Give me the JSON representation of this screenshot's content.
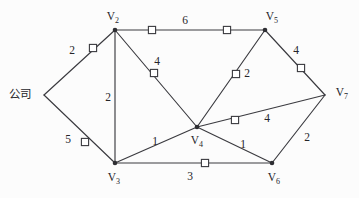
{
  "diagram": {
    "width": 359,
    "height": 198,
    "background_color": "#fcfcfc",
    "line_color": "#3a3a3f",
    "text_color": "#25252a",
    "marker_fill": "#ffffff"
  },
  "nodes": [
    {
      "id": "company",
      "label": "公司",
      "label_kind": "text",
      "x": 44,
      "y": 95,
      "label_x": 20,
      "label_y": 95,
      "has_dot": false
    },
    {
      "id": "v2",
      "label": "V",
      "sub": "2",
      "label_kind": "vertex",
      "x": 115,
      "y": 30,
      "label_x": 113,
      "label_y": 17,
      "has_dot": true
    },
    {
      "id": "v3",
      "label": "V",
      "sub": "3",
      "label_kind": "vertex",
      "x": 115,
      "y": 163,
      "label_x": 114,
      "label_y": 178,
      "has_dot": true
    },
    {
      "id": "v4",
      "label": "V",
      "sub": "4",
      "label_kind": "vertex",
      "x": 197,
      "y": 127,
      "label_x": 197,
      "label_y": 141,
      "has_dot": true
    },
    {
      "id": "v5",
      "label": "V",
      "sub": "5",
      "label_kind": "vertex",
      "x": 265,
      "y": 30,
      "label_x": 272,
      "label_y": 17,
      "has_dot": true
    },
    {
      "id": "v6",
      "label": "V",
      "sub": "6",
      "label_kind": "vertex",
      "x": 272,
      "y": 163,
      "label_x": 274,
      "label_y": 178,
      "has_dot": true
    },
    {
      "id": "v7",
      "label": "V",
      "sub": "7",
      "label_kind": "vertex",
      "x": 325,
      "y": 95,
      "label_x": 342,
      "label_y": 93,
      "has_dot": false
    }
  ],
  "edges": [
    {
      "id": "company-v2",
      "from": "company",
      "to": "v2",
      "weight": "2",
      "weight_x": 72,
      "weight_y": 51,
      "markers": [
        {
          "x": 93,
          "y": 48
        }
      ]
    },
    {
      "id": "company-v3",
      "from": "company",
      "to": "v3",
      "weight": "5",
      "weight_x": 68,
      "weight_y": 140,
      "markers": [
        {
          "x": 85,
          "y": 142
        }
      ]
    },
    {
      "id": "v2-v5",
      "from": "v2",
      "to": "v5",
      "weight": "6",
      "weight_x": 185,
      "weight_y": 21,
      "markers": [
        {
          "x": 152,
          "y": 30
        },
        {
          "x": 227,
          "y": 30
        }
      ]
    },
    {
      "id": "v2-v3",
      "from": "v2",
      "to": "v3",
      "weight": "2",
      "weight_x": 108,
      "weight_y": 98,
      "markers": []
    },
    {
      "id": "v2-v4",
      "from": "v2",
      "to": "v4",
      "weight": "4",
      "weight_x": 157,
      "weight_y": 62,
      "markers": [
        {
          "x": 154,
          "y": 73
        }
      ]
    },
    {
      "id": "v4-v5",
      "from": "v4",
      "to": "v5",
      "weight": "2",
      "weight_x": 247,
      "weight_y": 74,
      "markers": [
        {
          "x": 236,
          "y": 74
        }
      ]
    },
    {
      "id": "v5-v7",
      "from": "v5",
      "to": "v7",
      "weight": "4",
      "weight_x": 296,
      "weight_y": 51,
      "markers": [
        {
          "x": 301,
          "y": 68
        }
      ]
    },
    {
      "id": "v4-v7",
      "from": "v4",
      "to": "v7",
      "weight": "4",
      "weight_x": 267,
      "weight_y": 119,
      "markers": [
        {
          "x": 235,
          "y": 120
        }
      ]
    },
    {
      "id": "v3-v4",
      "from": "v3",
      "to": "v4",
      "weight": "1",
      "weight_x": 155,
      "weight_y": 142,
      "markers": []
    },
    {
      "id": "v4-v6",
      "from": "v4",
      "to": "v6",
      "weight": "1",
      "weight_x": 243,
      "weight_y": 145,
      "markers": []
    },
    {
      "id": "v3-v6",
      "from": "v3",
      "to": "v6",
      "weight": "3",
      "weight_x": 190,
      "weight_y": 177,
      "markers": [
        {
          "x": 205,
          "y": 163
        }
      ]
    },
    {
      "id": "v6-v7",
      "from": "v6",
      "to": "v7",
      "weight": "2",
      "weight_x": 307,
      "weight_y": 138,
      "markers": []
    }
  ]
}
